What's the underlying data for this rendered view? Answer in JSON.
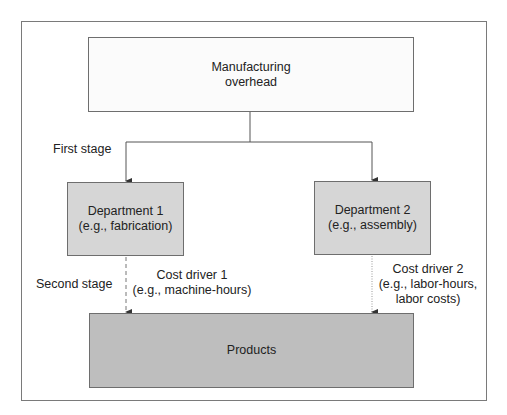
{
  "diagram": {
    "top_box": {
      "line1": "Manufacturing",
      "line2": "overhead"
    },
    "first_stage_label": "First stage",
    "second_stage_label": "Second stage",
    "departments": [
      {
        "line1": "Department 1",
        "line2": "(e.g., fabrication)"
      },
      {
        "line1": "Department 2",
        "line2": "(e.g., assembly)"
      }
    ],
    "cost_drivers": [
      {
        "line1": "Cost driver 1",
        "line2": "(e.g., machine-hours)"
      },
      {
        "line1": "Cost driver 2",
        "line2": "(e.g., labor-hours,",
        "line3": "labor costs)"
      }
    ],
    "bottom_box": {
      "label": "Products"
    },
    "colors": {
      "top_box_fill": "#fbfbfb",
      "department_fill": "#d6d6d6",
      "products_fill": "#bebebe",
      "border": "#6e6e6e"
    }
  }
}
